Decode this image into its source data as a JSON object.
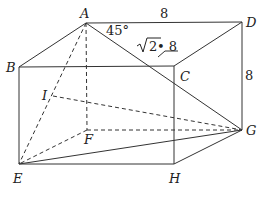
{
  "diagram": {
    "type": "geometry-cuboid",
    "points": {
      "A": {
        "label": "A"
      },
      "B": {
        "label": "B"
      },
      "C": {
        "label": "C"
      },
      "D": {
        "label": "D"
      },
      "E": {
        "label": "E"
      },
      "F": {
        "label": "F"
      },
      "G": {
        "label": "G"
      },
      "H": {
        "label": "H"
      },
      "I": {
        "label": "I"
      }
    },
    "annotations": {
      "angle": "45°",
      "edge_AD": "8",
      "edge_DG": "8",
      "diag_len_sqrt": "2",
      "diag_len_rest": " • 8"
    },
    "colors": {
      "stroke": "#333333",
      "text": "#222222"
    }
  }
}
